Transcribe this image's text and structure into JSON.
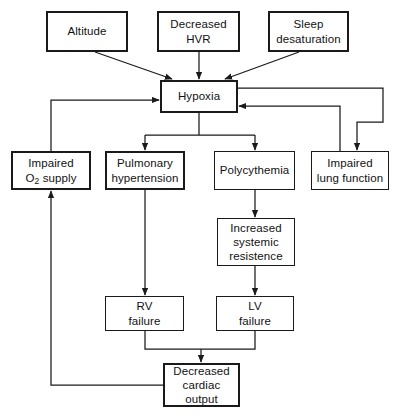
{
  "diagram": {
    "line_color": "#1a1a1a",
    "background_color": "#ffffff",
    "nodes": [
      {
        "id": "altitude",
        "label": "Altitude",
        "x": 46,
        "y": 11,
        "w": 82,
        "h": 41,
        "emphasis": true
      },
      {
        "id": "decreased_hvr",
        "label": "Decreased\nHVR",
        "x": 157,
        "y": 11,
        "w": 83,
        "h": 41,
        "emphasis": true
      },
      {
        "id": "sleep_desat",
        "label": "Sleep\ndesaturation",
        "x": 268,
        "y": 11,
        "w": 81,
        "h": 41,
        "emphasis": true
      },
      {
        "id": "hypoxia",
        "label": "Hypoxia",
        "x": 160,
        "y": 80,
        "w": 78,
        "h": 33,
        "emphasis": true
      },
      {
        "id": "impaired_o2",
        "label": "Impaired\nO2 supply",
        "x": 11,
        "y": 151,
        "w": 80,
        "h": 39,
        "emphasis": true
      },
      {
        "id": "pulm_htn",
        "label": "Pulmonary\nhypertension",
        "x": 105,
        "y": 151,
        "w": 80,
        "h": 39,
        "emphasis": true
      },
      {
        "id": "polycythemia",
        "label": "Polycythemia",
        "x": 214,
        "y": 151,
        "w": 81,
        "h": 39,
        "emphasis": false
      },
      {
        "id": "impaired_lung",
        "label": "Impaired\nlung function",
        "x": 311,
        "y": 151,
        "w": 78,
        "h": 39,
        "emphasis": false
      },
      {
        "id": "increased_svr",
        "label": "Increased\nsystemic\nresistence",
        "x": 217,
        "y": 218,
        "w": 78,
        "h": 48,
        "emphasis": false
      },
      {
        "id": "rv_failure",
        "label": "RV\nfailure",
        "x": 105,
        "y": 296,
        "w": 79,
        "h": 35,
        "emphasis": false
      },
      {
        "id": "lv_failure",
        "label": "LV\nfailure",
        "x": 216,
        "y": 296,
        "w": 78,
        "h": 35,
        "emphasis": false
      },
      {
        "id": "decreased_co",
        "label": "Decreased\ncardiac\noutput",
        "x": 163,
        "y": 363,
        "w": 77,
        "h": 44,
        "emphasis": true
      }
    ],
    "edges": [
      {
        "id": "altitude-to-hypoxia",
        "from": "altitude",
        "to": "hypoxia",
        "kind": "diagonal"
      },
      {
        "id": "hvr-to-hypoxia",
        "from": "decreased_hvr",
        "to": "hypoxia",
        "kind": "straight"
      },
      {
        "id": "sleep-to-hypoxia",
        "from": "sleep_desat",
        "to": "hypoxia",
        "kind": "diagonal"
      },
      {
        "id": "hypoxia-to-pulm-htn",
        "from": "hypoxia",
        "to": "pulm_htn",
        "kind": "elbow"
      },
      {
        "id": "hypoxia-to-polycythemia",
        "from": "hypoxia",
        "to": "polycythemia",
        "kind": "elbow"
      },
      {
        "id": "hypoxia-to-impaired-lung",
        "from": "hypoxia",
        "to": "impaired_lung",
        "kind": "elbow"
      },
      {
        "id": "impaired-lung-to-hypoxia",
        "from": "impaired_lung",
        "to": "hypoxia",
        "kind": "feedback"
      },
      {
        "id": "impaired-o2-to-hypoxia",
        "from": "impaired_o2",
        "to": "hypoxia",
        "kind": "feedback"
      },
      {
        "id": "pulm-htn-to-rv-failure",
        "from": "pulm_htn",
        "to": "rv_failure",
        "kind": "straight"
      },
      {
        "id": "polycythemia-to-svr",
        "from": "polycythemia",
        "to": "increased_svr",
        "kind": "straight"
      },
      {
        "id": "svr-to-lv-failure",
        "from": "increased_svr",
        "to": "lv_failure",
        "kind": "straight"
      },
      {
        "id": "rv-failure-to-output",
        "from": "rv_failure",
        "to": "decreased_co",
        "kind": "elbow"
      },
      {
        "id": "lv-failure-to-output",
        "from": "lv_failure",
        "to": "decreased_co",
        "kind": "elbow"
      },
      {
        "id": "output-to-impaired-o2",
        "from": "decreased_co",
        "to": "impaired_o2",
        "kind": "feedback"
      }
    ]
  }
}
